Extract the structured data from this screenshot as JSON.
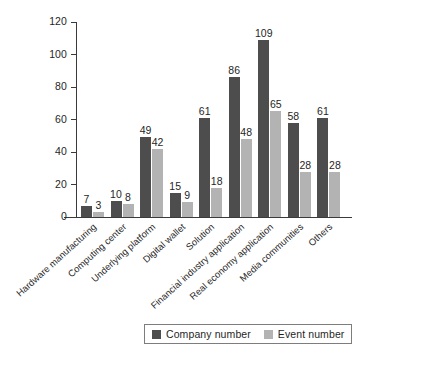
{
  "chart_data": {
    "type": "bar",
    "title": "",
    "subtitle": "",
    "xlabel": "",
    "ylabel": "",
    "ylim": [
      0,
      120
    ],
    "yticks": [
      0,
      20,
      40,
      60,
      80,
      100,
      120
    ],
    "grid": false,
    "legend_position": "bottom",
    "categories": [
      "Hardware manufacturing",
      "Computing center",
      "Underlying platform",
      "Digital wallet",
      "Solution",
      "Financial industry application",
      "Real economy application",
      "Media communities",
      "Others"
    ],
    "series": [
      {
        "name": "Company number",
        "color": "#4d4d4d",
        "values": [
          7,
          10,
          49,
          15,
          61,
          86,
          109,
          58,
          61
        ]
      },
      {
        "name": "Event number",
        "color": "#b3b3b3",
        "values": [
          3,
          8,
          42,
          9,
          18,
          48,
          65,
          28,
          28
        ]
      }
    ]
  },
  "legend": {
    "items": [
      {
        "label": "Company number",
        "color": "#4d4d4d"
      },
      {
        "label": "Event number",
        "color": "#b3b3b3"
      }
    ]
  },
  "axes": {
    "y_tick_labels": [
      "120",
      "100",
      "80",
      "60",
      "40",
      "20",
      "0"
    ]
  }
}
